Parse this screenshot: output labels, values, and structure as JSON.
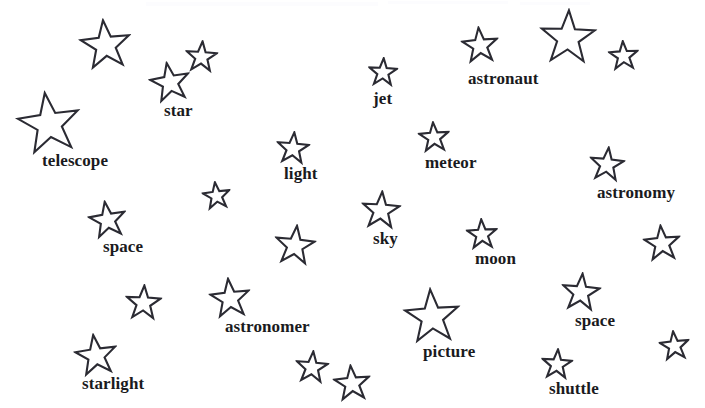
{
  "page": {
    "background_color": "#ffffff",
    "ink_color": "#2b2b33",
    "text_color": "#1a1a20",
    "width": 705,
    "height": 408
  },
  "stars": [
    {
      "id": "star-1",
      "label": "",
      "x": 79,
      "y": 18,
      "size": 53,
      "rotation": -6,
      "label_x": 0,
      "label_y": 0,
      "label_size": 0
    },
    {
      "id": "star-2",
      "label": "",
      "x": 185,
      "y": 40,
      "size": 33,
      "rotation": 4,
      "label_x": 0,
      "label_y": 0,
      "label_size": 0
    },
    {
      "id": "star-3",
      "label": "star",
      "x": 149,
      "y": 61,
      "size": 42,
      "rotation": -10,
      "label_x": 15,
      "label_y": 41,
      "label_size": 17
    },
    {
      "id": "star-4",
      "label": "telescope",
      "x": 16,
      "y": 90,
      "size": 66,
      "rotation": -8,
      "label_x": 26,
      "label_y": 62,
      "label_size": 17
    },
    {
      "id": "star-5",
      "label": "jet",
      "x": 368,
      "y": 57,
      "size": 30,
      "rotation": 3,
      "label_x": 5,
      "label_y": 33,
      "label_size": 17
    },
    {
      "id": "star-6",
      "label": "astronaut",
      "x": 461,
      "y": 26,
      "size": 38,
      "rotation": -5,
      "label_x": 7,
      "label_y": 44,
      "label_size": 17
    },
    {
      "id": "star-7",
      "label": "",
      "x": 539,
      "y": 8,
      "size": 58,
      "rotation": 2,
      "label_x": 0,
      "label_y": 0,
      "label_size": 0
    },
    {
      "id": "star-8",
      "label": "",
      "x": 608,
      "y": 40,
      "size": 31,
      "rotation": -3,
      "label_x": 0,
      "label_y": 0,
      "label_size": 0
    },
    {
      "id": "star-9",
      "label": "light",
      "x": 276,
      "y": 131,
      "size": 34,
      "rotation": 5,
      "label_x": 8,
      "label_y": 34,
      "label_size": 17
    },
    {
      "id": "star-10",
      "label": "meteor",
      "x": 418,
      "y": 121,
      "size": 32,
      "rotation": -4,
      "label_x": 7,
      "label_y": 33,
      "label_size": 17
    },
    {
      "id": "star-11",
      "label": "astronomy",
      "x": 589,
      "y": 146,
      "size": 36,
      "rotation": 6,
      "label_x": 8,
      "label_y": 38,
      "label_size": 17
    },
    {
      "id": "star-12",
      "label": "",
      "x": 202,
      "y": 181,
      "size": 29,
      "rotation": -7,
      "label_x": 0,
      "label_y": 0,
      "label_size": 0
    },
    {
      "id": "star-13",
      "label": "space",
      "x": 88,
      "y": 200,
      "size": 39,
      "rotation": -9,
      "label_x": 15,
      "label_y": 38,
      "label_size": 17
    },
    {
      "id": "star-14",
      "label": "sky",
      "x": 361,
      "y": 190,
      "size": 40,
      "rotation": 4,
      "label_x": 12,
      "label_y": 40,
      "label_size": 17
    },
    {
      "id": "star-15",
      "label": "moon",
      "x": 466,
      "y": 218,
      "size": 32,
      "rotation": -3,
      "label_x": 9,
      "label_y": 32,
      "label_size": 17
    },
    {
      "id": "star-16",
      "label": "",
      "x": 274,
      "y": 224,
      "size": 42,
      "rotation": 6,
      "label_x": 0,
      "label_y": 0,
      "label_size": 0
    },
    {
      "id": "star-17",
      "label": "",
      "x": 643,
      "y": 224,
      "size": 38,
      "rotation": -5,
      "label_x": 0,
      "label_y": 0,
      "label_size": 0
    },
    {
      "id": "star-18",
      "label": "",
      "x": 125,
      "y": 284,
      "size": 37,
      "rotation": 3,
      "label_x": 0,
      "label_y": 0,
      "label_size": 0
    },
    {
      "id": "star-19",
      "label": "astronomer",
      "x": 209,
      "y": 277,
      "size": 42,
      "rotation": -6,
      "label_x": 16,
      "label_y": 41,
      "label_size": 17
    },
    {
      "id": "star-20",
      "label": "space",
      "x": 561,
      "y": 272,
      "size": 40,
      "rotation": 5,
      "label_x": 14,
      "label_y": 40,
      "label_size": 17
    },
    {
      "id": "star-21",
      "label": "picture",
      "x": 403,
      "y": 287,
      "size": 58,
      "rotation": -4,
      "label_x": 20,
      "label_y": 56,
      "label_size": 17
    },
    {
      "id": "star-22",
      "label": "starlight",
      "x": 74,
      "y": 333,
      "size": 44,
      "rotation": -8,
      "label_x": 8,
      "label_y": 42,
      "label_size": 17
    },
    {
      "id": "star-23",
      "label": "",
      "x": 295,
      "y": 350,
      "size": 34,
      "rotation": 5,
      "label_x": 0,
      "label_y": 0,
      "label_size": 0
    },
    {
      "id": "star-24",
      "label": "",
      "x": 333,
      "y": 364,
      "size": 38,
      "rotation": -5,
      "label_x": 0,
      "label_y": 0,
      "label_size": 0
    },
    {
      "id": "star-25",
      "label": "shuttle",
      "x": 541,
      "y": 348,
      "size": 32,
      "rotation": 4,
      "label_x": 8,
      "label_y": 32,
      "label_size": 17
    },
    {
      "id": "star-26",
      "label": "",
      "x": 659,
      "y": 330,
      "size": 31,
      "rotation": -6,
      "label_x": 0,
      "label_y": 0,
      "label_size": 0
    }
  ],
  "words": [
    "star",
    "telescope",
    "jet",
    "astronaut",
    "light",
    "meteor",
    "astronomy",
    "space",
    "sky",
    "moon",
    "astronomer",
    "space",
    "picture",
    "starlight",
    "shuttle"
  ],
  "smudges": [
    {
      "x": 146,
      "y": 2,
      "width": 232,
      "height": 4
    },
    {
      "x": 388,
      "y": 1,
      "width": 120,
      "height": 3
    },
    {
      "x": 520,
      "y": 2,
      "width": 70,
      "height": 3
    }
  ]
}
